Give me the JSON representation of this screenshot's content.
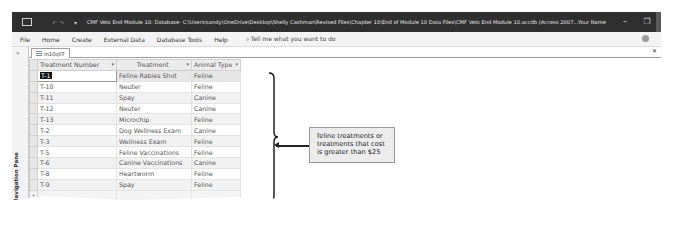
{
  "window": {
    "title": "CMF Vets End Module 10: Database- C:\\Users\\sandy\\OneDrive\\Desktop\\Shelly Cashman\\Revised Files\\Chapter 10\\End of Module 10 Data Files\\CMF Vets End Module 10.accdb (Access 2007...",
    "user_name": "Your Name",
    "minimize": "–",
    "restore": "❐",
    "close": "✕"
  },
  "ribbon": {
    "tabs": [
      "File",
      "Home",
      "Create",
      "External Data",
      "Database Tools",
      "Help"
    ],
    "tell_me": "Tell me what you want to do"
  },
  "nav_pane": {
    "toggle": "»",
    "label": "Navigation Pane"
  },
  "document_tab": {
    "name": "m10q07",
    "close": "✕"
  },
  "datasheet": {
    "columns": [
      "Treatment Number",
      "Treatment",
      "Animal Type"
    ],
    "rows": [
      [
        "T-1",
        "Feline Rabies Shot",
        "Feline"
      ],
      [
        "T-10",
        "Neuter",
        "Feline"
      ],
      [
        "T-11",
        "Spay",
        "Canine"
      ],
      [
        "T-12",
        "Neuter",
        "Canine"
      ],
      [
        "T-13",
        "Microchip",
        "Feline"
      ],
      [
        "T-2",
        "Dog Wellness Exam",
        "Canine"
      ],
      [
        "T-3",
        "Wellness Exam",
        "Feline"
      ],
      [
        "T-5",
        "Feline Vaccinations",
        "Feline"
      ],
      [
        "T-6",
        "Canine Vaccinations",
        "Canine"
      ],
      [
        "T-8",
        "Heartworm",
        "Feline"
      ],
      [
        "T-9",
        "Spay",
        "Feline"
      ]
    ],
    "new_row_marker": "*",
    "sort_arrow": "▾"
  },
  "callout": {
    "line1": "feline treatments or",
    "line2": "treatments that cost",
    "line3": "is greater than $25"
  }
}
